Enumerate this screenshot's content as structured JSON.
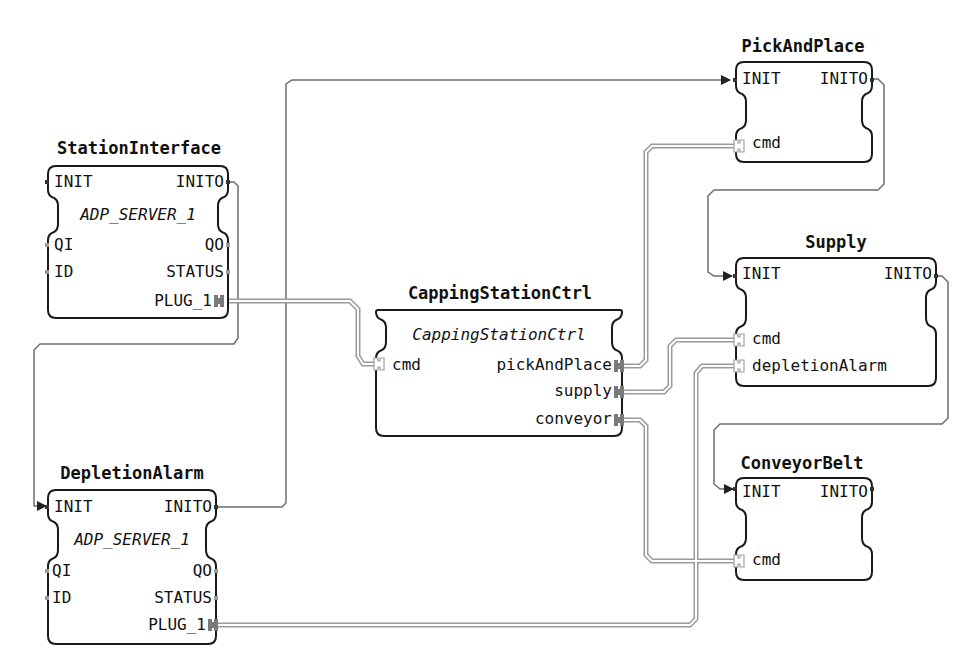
{
  "blocks": {
    "station_interface": {
      "name": "StationInterface",
      "type": "ADP_SERVER_1",
      "event_inputs": [
        "INIT"
      ],
      "event_outputs": [
        "INITO"
      ],
      "data_inputs": [
        "QI",
        "ID"
      ],
      "data_outputs": [
        "QO",
        "STATUS"
      ],
      "adapter_plugs": [
        "PLUG_1"
      ]
    },
    "depletion_alarm": {
      "name": "DepletionAlarm",
      "type": "ADP_SERVER_1",
      "event_inputs": [
        "INIT"
      ],
      "event_outputs": [
        "INITO"
      ],
      "data_inputs": [
        "QI",
        "ID"
      ],
      "data_outputs": [
        "QO",
        "STATUS"
      ],
      "adapter_plugs": [
        "PLUG_1"
      ]
    },
    "capping_station_ctrl": {
      "name": "CappingStationCtrl",
      "type": "CappingStationCtrl",
      "adapter_sockets": [
        "cmd"
      ],
      "adapter_plugs": [
        "pickAndPlace",
        "supply",
        "conveyor"
      ]
    },
    "pick_and_place": {
      "name": "PickAndPlace",
      "event_inputs": [
        "INIT"
      ],
      "event_outputs": [
        "INITO"
      ],
      "adapter_sockets": [
        "cmd"
      ]
    },
    "supply": {
      "name": "Supply",
      "event_inputs": [
        "INIT"
      ],
      "event_outputs": [
        "INITO"
      ],
      "adapter_sockets": [
        "cmd",
        "depletionAlarm"
      ]
    },
    "conveyor_belt": {
      "name": "ConveyorBelt",
      "event_inputs": [
        "INIT"
      ],
      "event_outputs": [
        "INITO"
      ],
      "adapter_sockets": [
        "cmd"
      ]
    }
  },
  "connections": [
    {
      "from": "StationInterface.INITO",
      "to": "DepletionAlarm.INIT",
      "kind": "event"
    },
    {
      "from": "DepletionAlarm.INITO",
      "to": "PickAndPlace.INIT",
      "kind": "event"
    },
    {
      "from": "PickAndPlace.INITO",
      "to": "Supply.INIT",
      "kind": "event"
    },
    {
      "from": "Supply.INITO",
      "to": "ConveyorBelt.INIT",
      "kind": "event"
    },
    {
      "from": "StationInterface.PLUG_1",
      "to": "CappingStationCtrl.cmd",
      "kind": "adapter"
    },
    {
      "from": "CappingStationCtrl.pickAndPlace",
      "to": "PickAndPlace.cmd",
      "kind": "adapter"
    },
    {
      "from": "CappingStationCtrl.supply",
      "to": "Supply.cmd",
      "kind": "adapter"
    },
    {
      "from": "CappingStationCtrl.conveyor",
      "to": "ConveyorBelt.cmd",
      "kind": "adapter"
    },
    {
      "from": "DepletionAlarm.PLUG_1",
      "to": "Supply.depletionAlarm",
      "kind": "adapter"
    }
  ],
  "colors": {
    "block_border": "#1a1a1a",
    "event_wire": "#6e6e6e",
    "adapter_wire": "#9a9a9a",
    "adapter_plug": "#7a7a7a",
    "adapter_socket": "#c8c8c8"
  }
}
